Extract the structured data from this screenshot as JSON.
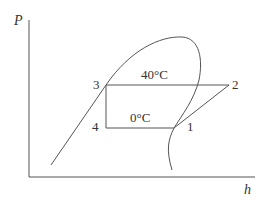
{
  "diagram": {
    "type": "pressure-enthalpy (P-h) diagram, vapor-compression refrigeration cycle",
    "axes": {
      "y_label": "P",
      "x_label": "h"
    },
    "states": [
      {
        "id": "1",
        "label": "1"
      },
      {
        "id": "2",
        "label": "2"
      },
      {
        "id": "3",
        "label": "3"
      },
      {
        "id": "4",
        "label": "4"
      }
    ],
    "annotations": {
      "condensing_temp": "40°C",
      "evaporating_temp": "0°C"
    },
    "colors": {
      "line": "#555555",
      "text": "#333333",
      "background": "#ffffff"
    }
  }
}
